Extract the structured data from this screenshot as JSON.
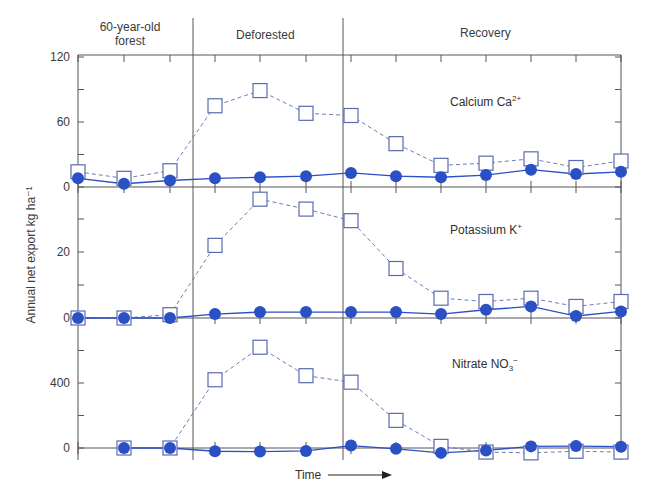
{
  "chart_data": {
    "type": "line",
    "title": "",
    "xlabel": "Time",
    "ylabel": "Annual net export kg ha⁻¹",
    "x": [
      1,
      2,
      3,
      4,
      5,
      6,
      7,
      8,
      9,
      10,
      11,
      12,
      13
    ],
    "periods": [
      {
        "label": "60-year-old forest",
        "x_range": [
          1,
          3
        ]
      },
      {
        "label": "Deforested",
        "x_range": [
          4,
          6
        ]
      },
      {
        "label": "Recovery",
        "x_range": [
          7,
          13
        ]
      }
    ],
    "legend": {
      "open_square_dashed": "Deforested watershed",
      "filled_circle_solid": "Control (forested) watershed"
    },
    "panels": [
      {
        "name": "Calcium",
        "title": "Calcium Ca",
        "title_sup": "2+",
        "title_sub": "",
        "ylim": [
          0,
          120
        ],
        "yticks_labeled": [
          0,
          60,
          120
        ],
        "yticks_minor": [
          30,
          90
        ],
        "series": [
          {
            "name": "deforested",
            "marker": "open-square",
            "line": "dashed",
            "values": [
              14,
              8,
              15,
              75,
              89,
              68,
              66,
              40,
              20,
              22,
              26,
              18,
              24
            ]
          },
          {
            "name": "control",
            "marker": "filled-circle",
            "line": "solid",
            "values": [
              8,
              3,
              6,
              8,
              9,
              10,
              13,
              10,
              9,
              11,
              16,
              12,
              14
            ]
          }
        ]
      },
      {
        "name": "Potassium",
        "title": "Potassium K",
        "title_sup": "+",
        "title_sub": "",
        "ylim": [
          0,
          40
        ],
        "yticks_labeled": [
          0,
          20
        ],
        "yticks_minor": [
          10,
          30
        ],
        "series": [
          {
            "name": "deforested",
            "marker": "open-square",
            "line": "dashed",
            "values": [
              0,
              0,
              1,
              22,
              36,
              33,
              29.5,
              15,
              6,
              5,
              6,
              3.5,
              5
            ]
          },
          {
            "name": "control",
            "marker": "filled-circle",
            "line": "solid",
            "values": [
              0,
              0,
              0,
              1.2,
              1.8,
              1.8,
              1.8,
              1.8,
              1.2,
              2.5,
              3.5,
              0.6,
              2
            ]
          }
        ]
      },
      {
        "name": "Nitrate",
        "title": "Nitrate NO",
        "title_sup": "−",
        "title_sub": "3",
        "ylim": [
          -80,
          800
        ],
        "yticks_labeled": [
          0,
          400
        ],
        "yticks_minor": [
          200,
          600
        ],
        "series": [
          {
            "name": "deforested",
            "marker": "open-square",
            "line": "dashed",
            "values": [
              null,
              0,
              0,
              420,
              620,
              445,
              405,
              170,
              10,
              -25,
              -30,
              -20,
              -25
            ]
          },
          {
            "name": "control",
            "marker": "filled-circle",
            "line": "solid",
            "values": [
              null,
              0,
              0,
              -20,
              -22,
              -18,
              15,
              -5,
              -30,
              -15,
              10,
              12,
              8
            ]
          }
        ]
      }
    ]
  },
  "labels": {
    "period_1_line1": "60-year-old",
    "period_1_line2": "forest",
    "period_2": "Deforested",
    "period_3": "Recovery",
    "ylabel": "Annual net export kg ha⁻¹",
    "time": "Time",
    "ticks": {
      "ca_120": "120",
      "ca_60": "60",
      "ca_0": "0",
      "k_20": "20",
      "k_0": "0",
      "no3_400": "400",
      "no3_0": "0"
    },
    "panel_titles": {
      "ca": "Calcium Ca",
      "ca_sup": "2+",
      "k": "Potassium K",
      "k_sup": "+",
      "no3": "Nitrate NO",
      "no3_sub": "3",
      "no3_sup": "−"
    }
  },
  "colors": {
    "marker": "#2b4fc4",
    "square_stroke": "#5a6ab0",
    "axis": "#555555",
    "dash": "#6f7bb5"
  }
}
